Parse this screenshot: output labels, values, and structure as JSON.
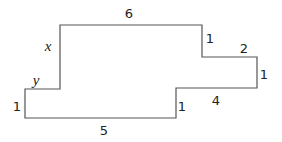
{
  "diagram": {
    "type": "rectilinear-polygon",
    "stroke_color": "#555555",
    "background": "#ffffff",
    "vertices": [
      [
        60,
        25
      ],
      [
        202,
        25
      ],
      [
        202,
        57
      ],
      [
        257,
        57
      ],
      [
        257,
        88
      ],
      [
        176,
        88
      ],
      [
        176,
        118
      ],
      [
        25,
        118
      ],
      [
        25,
        89
      ],
      [
        60,
        89
      ]
    ],
    "labels": [
      {
        "id": "top",
        "text": "6",
        "x": 129,
        "y": 13,
        "variable": false
      },
      {
        "id": "right-step-1",
        "text": "1",
        "x": 210,
        "y": 38,
        "variable": false
      },
      {
        "id": "right-step-2",
        "text": "2",
        "x": 244,
        "y": 48,
        "variable": false
      },
      {
        "id": "right-edge",
        "text": "1",
        "x": 264,
        "y": 74,
        "variable": false
      },
      {
        "id": "lower-right",
        "text": "4",
        "x": 216,
        "y": 100,
        "variable": false
      },
      {
        "id": "inner-step",
        "text": "1",
        "x": 182,
        "y": 106,
        "variable": false
      },
      {
        "id": "bottom",
        "text": "5",
        "x": 104,
        "y": 130,
        "variable": false
      },
      {
        "id": "left-edge",
        "text": "1",
        "x": 17,
        "y": 106,
        "variable": false
      },
      {
        "id": "y-segment",
        "text": "y",
        "x": 36,
        "y": 80,
        "variable": true
      },
      {
        "id": "x-segment",
        "text": "x",
        "x": 48,
        "y": 46,
        "variable": true
      }
    ]
  }
}
